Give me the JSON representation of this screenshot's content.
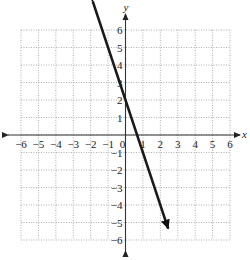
{
  "chart_data": {
    "type": "line",
    "title": "",
    "xlabel": "x",
    "ylabel": "y",
    "xlim": [
      -6,
      6
    ],
    "ylim": [
      -6,
      6
    ],
    "grid": true,
    "grid_style": "dotted",
    "x_ticks": [
      "-6",
      "-5",
      "-4",
      "-3",
      "-2",
      "-1",
      "0",
      "1",
      "2",
      "3",
      "4",
      "5",
      "6"
    ],
    "y_ticks": [
      "-6",
      "-5",
      "-4",
      "-3",
      "-2",
      "-1",
      "1",
      "2",
      "3",
      "4",
      "5",
      "6"
    ],
    "series": [
      {
        "name": "line",
        "equation": "y = -3x + 2",
        "slope": -3,
        "intercept": 2,
        "arrows_both_ends": true,
        "x": [
          -1.88,
          -1,
          0,
          0.667,
          1,
          2,
          2.45
        ],
        "y": [
          7.6,
          5,
          2,
          0,
          -1,
          -4,
          -6.9
        ]
      }
    ],
    "colors": {
      "line": "#1a1a1a",
      "grid": "#9a9a9a",
      "axis": "#333333"
    }
  }
}
